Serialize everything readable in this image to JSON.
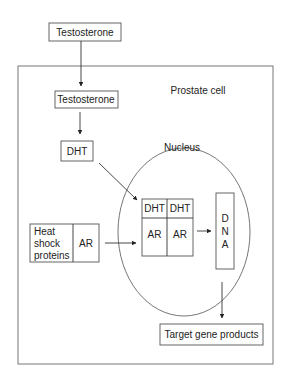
{
  "diagram": {
    "nodes": {
      "testosterone_outside": "Testosterone",
      "cell_label": "Prostate cell",
      "testosterone_inside": "Testosterone",
      "dht": "DHT",
      "nucleus_label": "Nucleus",
      "hsp_line1": "Heat",
      "hsp_line2": "shock",
      "hsp_line3": "proteins",
      "hsp_ar": "AR",
      "complex_dht_left": "DHT",
      "complex_dht_right": "DHT",
      "complex_ar_left": "AR",
      "complex_ar_right": "AR",
      "dna_d": "D",
      "dna_n": "N",
      "dna_a": "A",
      "target": "Target gene products"
    },
    "edges": [
      {
        "from": "Testosterone (outside)",
        "to": "Testosterone (inside cell)"
      },
      {
        "from": "Testosterone (inside cell)",
        "to": "DHT"
      },
      {
        "from": "DHT",
        "to": "DHT-AR complex"
      },
      {
        "from": "Heat shock proteins / AR",
        "to": "DHT-AR complex"
      },
      {
        "from": "DHT-AR complex",
        "to": "DNA"
      },
      {
        "from": "DNA",
        "to": "Target gene products"
      }
    ],
    "colors": {
      "stroke": "#555555",
      "text": "#222222",
      "background": "#ffffff"
    }
  }
}
